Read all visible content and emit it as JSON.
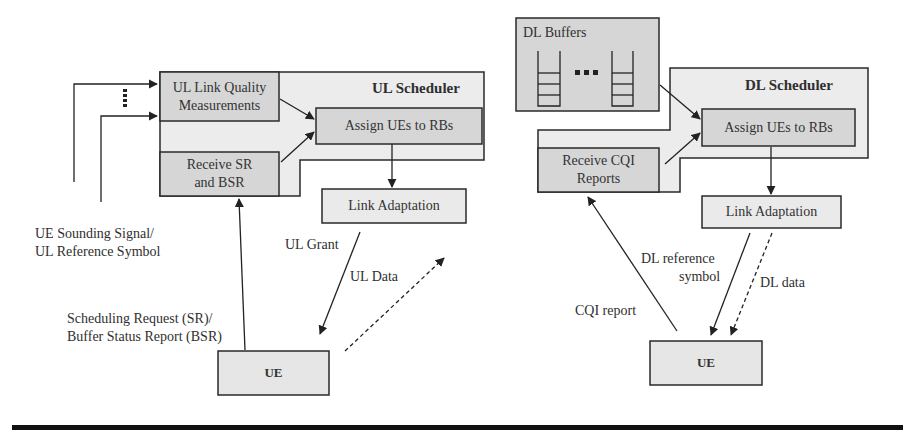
{
  "diagram": {
    "ul": {
      "scheduler_title": "UL Scheduler",
      "link_quality_box": "UL Link Quality Measurements",
      "link_quality_line1": "UL Link Quality",
      "link_quality_line2": "Measurements",
      "receive_box_line1": "Receive SR",
      "receive_box_line2": "and BSR",
      "assign_box": "Assign UEs to RBs",
      "link_adaptation_box": "Link Adaptation",
      "ue_box": "UE",
      "sounding_label_line1": "UE Sounding Signal/",
      "sounding_label_line2": "UL Reference Symbol",
      "sr_label_line1": "Scheduling Request (SR)/",
      "sr_label_line2": "Buffer Status Report (BSR)",
      "grant_label": "UL Grant",
      "data_label": "UL Data"
    },
    "dl": {
      "buffers_title": "DL Buffers",
      "scheduler_title": "DL Scheduler",
      "receive_box_line1": "Receive CQI",
      "receive_box_line2": "Reports",
      "assign_box": "Assign UEs to RBs",
      "link_adaptation_box": "Link Adaptation",
      "ue_box": "UE",
      "cqi_label": "CQI report",
      "ref_label_line1": "DL reference",
      "ref_label_line2": "symbol",
      "data_label": "DL data"
    },
    "colors": {
      "outer_fill": "#ececec",
      "inner_fill": "#d6d6d6",
      "light_box_fill": "#eaeaea",
      "stroke": "#2a2a2a"
    }
  }
}
